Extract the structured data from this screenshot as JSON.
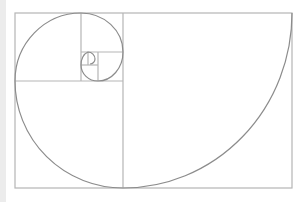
{
  "diagram": {
    "title": "",
    "type": "golden-spiral",
    "colors": {
      "background": "#ffffff",
      "frame": "#b5b5b5",
      "spiral": "#8c8c8c",
      "left_strip": "#ececec"
    },
    "outer_rect": {
      "x": 15,
      "y": 13,
      "w": 277,
      "h": 175
    },
    "divider_lines": [
      {
        "x1": 123,
        "y1": 13,
        "x2": 123,
        "y2": 188
      },
      {
        "x1": 15,
        "y1": 81,
        "x2": 123,
        "y2": 81
      },
      {
        "x1": 81,
        "y1": 13,
        "x2": 81,
        "y2": 81
      },
      {
        "x1": 81,
        "y1": 52,
        "x2": 123,
        "y2": 52
      },
      {
        "x1": 98,
        "y1": 52,
        "x2": 98,
        "y2": 81
      },
      {
        "x1": 81,
        "y1": 65,
        "x2": 98,
        "y2": 65
      },
      {
        "x1": 88,
        "y1": 52,
        "x2": 88,
        "y2": 65
      }
    ]
  }
}
